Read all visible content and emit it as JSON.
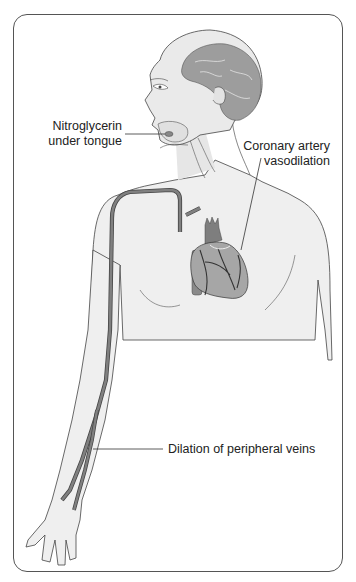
{
  "figure": {
    "labels": {
      "nitro_line1": "Nitroglycerin",
      "nitro_line2": "under tongue",
      "coronary_line1": "Coronary artery",
      "coronary_line2": "vasodilation",
      "veins": "Dilation of peripheral veins"
    },
    "colors": {
      "outline": "#444444",
      "skin": "#eeeeee",
      "skin_shade": "#d8d8d8",
      "brain": "#9a9a9a",
      "vessel": "#7a7a7a",
      "heart": "#8c8c8c",
      "frame": "#555555"
    }
  }
}
